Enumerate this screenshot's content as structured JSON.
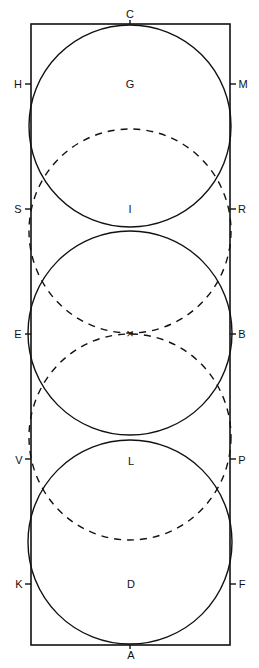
{
  "rect": {
    "x": 31,
    "y": 24,
    "w": 199,
    "h": 621
  },
  "circles": [
    {
      "name": "circle-top",
      "cx": 130,
      "cy": 126,
      "r": 101
    },
    {
      "name": "circle-middle",
      "cx": 130,
      "cy": 333,
      "r": 102
    },
    {
      "name": "circle-bottom",
      "cx": 130,
      "cy": 542,
      "r": 102
    }
  ],
  "dashed_circles": [
    {
      "name": "dashed-circle-upper",
      "cx": 130,
      "cy": 231,
      "rx": 101,
      "ry": 102
    },
    {
      "name": "dashed-circle-lower",
      "cx": 130,
      "cy": 437,
      "rx": 101,
      "ry": 103
    }
  ],
  "labels": [
    {
      "id": "C",
      "text": "C",
      "x": 130,
      "y": 14
    },
    {
      "id": "H",
      "text": "H",
      "x": 18,
      "y": 84
    },
    {
      "id": "M",
      "text": "M",
      "x": 243,
      "y": 84
    },
    {
      "id": "G",
      "text": "G",
      "x": 130,
      "y": 84
    },
    {
      "id": "S",
      "text": "S",
      "x": 18,
      "y": 209
    },
    {
      "id": "R",
      "text": "R",
      "x": 242,
      "y": 209
    },
    {
      "id": "I",
      "text": "I",
      "x": 130,
      "y": 209
    },
    {
      "id": "E",
      "text": "E",
      "x": 18,
      "y": 334
    },
    {
      "id": "B",
      "text": "B",
      "x": 242,
      "y": 334
    },
    {
      "id": "V",
      "text": "V",
      "x": 19,
      "y": 460
    },
    {
      "id": "P",
      "text": "P",
      "x": 242,
      "y": 460
    },
    {
      "id": "L",
      "text": "L",
      "x": 131,
      "y": 461
    },
    {
      "id": "K",
      "text": "K",
      "x": 19,
      "y": 584
    },
    {
      "id": "F",
      "text": "F",
      "x": 242,
      "y": 584
    },
    {
      "id": "D",
      "text": "D",
      "x": 131,
      "y": 584
    },
    {
      "id": "A",
      "text": "A",
      "x": 131,
      "y": 655
    }
  ],
  "ticks": [
    {
      "x1": 130,
      "y1": 20,
      "x2": 130,
      "y2": 24
    },
    {
      "x1": 25,
      "y1": 84,
      "x2": 31,
      "y2": 84
    },
    {
      "x1": 230,
      "y1": 84,
      "x2": 236,
      "y2": 84
    },
    {
      "x1": 25,
      "y1": 209,
      "x2": 31,
      "y2": 209
    },
    {
      "x1": 230,
      "y1": 209,
      "x2": 236,
      "y2": 209
    },
    {
      "x1": 25,
      "y1": 334,
      "x2": 31,
      "y2": 334
    },
    {
      "x1": 230,
      "y1": 334,
      "x2": 236,
      "y2": 334
    },
    {
      "x1": 25,
      "y1": 459,
      "x2": 31,
      "y2": 459
    },
    {
      "x1": 230,
      "y1": 459,
      "x2": 236,
      "y2": 459
    },
    {
      "x1": 25,
      "y1": 584,
      "x2": 31,
      "y2": 584
    },
    {
      "x1": 230,
      "y1": 584,
      "x2": 236,
      "y2": 584
    },
    {
      "x1": 130,
      "y1": 645,
      "x2": 130,
      "y2": 649
    }
  ],
  "center_mark": {
    "label": "×",
    "x": 130,
    "y": 334
  },
  "colors": {
    "stroke": "#111111",
    "background": "#ffffff"
  }
}
